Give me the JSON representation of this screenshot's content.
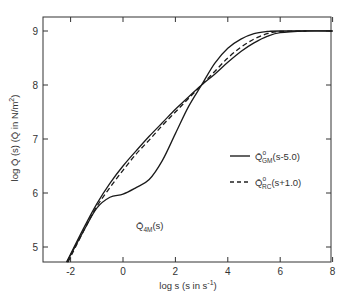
{
  "chart_data": {
    "type": "line",
    "title": "",
    "xlabel": "log s (s in s⁻¹)",
    "ylabel": "log Q̄ (s) (Q̄ in N/m²)",
    "xlim": [
      -2.9,
      8
    ],
    "ylim": [
      4.72,
      9.25
    ],
    "x_ticks": [
      -2,
      0,
      2,
      4,
      6,
      8
    ],
    "y_ticks": [
      5,
      6,
      7,
      8,
      9
    ],
    "grid": false,
    "legend_position": "center-right",
    "series": [
      {
        "name": "Q̄°GM(s-5.0)",
        "style": "solid",
        "x": [
          -2.15,
          -1.5,
          -1,
          -0.5,
          0,
          0.5,
          1,
          1.5,
          2,
          2.5,
          3,
          3.5,
          4,
          4.5,
          5,
          5.5,
          6,
          7,
          8
        ],
        "y": [
          4.72,
          5.35,
          5.8,
          6.18,
          6.5,
          6.78,
          7.05,
          7.3,
          7.55,
          7.78,
          8.0,
          8.2,
          8.42,
          8.62,
          8.78,
          8.9,
          8.97,
          9.0,
          9.0
        ]
      },
      {
        "name": "Q̄°RC(s+1.0)",
        "style": "dashed",
        "x": [
          -2.1,
          -1.5,
          -1,
          -0.5,
          0,
          0.5,
          1,
          1.5,
          2,
          2.5,
          3,
          3.5,
          4,
          4.5,
          5,
          5.5,
          6,
          7
        ],
        "y": [
          4.72,
          5.3,
          5.75,
          6.1,
          6.42,
          6.72,
          6.98,
          7.25,
          7.5,
          7.75,
          8.0,
          8.25,
          8.5,
          8.7,
          8.85,
          8.95,
          8.99,
          9.0
        ]
      },
      {
        "name": "Q̄ 4M(s)",
        "style": "solid",
        "x": [
          -2.15,
          -1.5,
          -1,
          -0.5,
          0,
          0.5,
          1,
          1.5,
          2,
          2.5,
          3,
          3.5,
          4,
          4.5,
          5,
          5.5,
          6,
          8
        ],
        "y": [
          4.72,
          5.3,
          5.72,
          5.92,
          5.98,
          6.1,
          6.25,
          6.6,
          7.1,
          7.6,
          8.0,
          8.4,
          8.68,
          8.85,
          8.95,
          8.99,
          9.0,
          9.0
        ]
      }
    ],
    "annotations": [
      {
        "text": "Q̄",
        "sub": "4M",
        "suffix": "(s)",
        "x": 0.7,
        "y": 5.72
      }
    ]
  },
  "labels": {
    "xlabel_main": "log s (s in s",
    "xlabel_sup": "-1",
    "xlabel_end": ")",
    "ylabel_main": "log Q̄ (s) (Q̄ in N/m",
    "ylabel_sup": "2",
    "ylabel_end": ")",
    "legend": [
      {
        "q": "Q̄",
        "sup": "o",
        "sub": "GM",
        "arg": "(s-5.0)"
      },
      {
        "q": "Q̄",
        "sup": "o",
        "sub": "RC",
        "arg": "(s+1.0)"
      }
    ],
    "annot_q": "Q̄",
    "annot_sub": "4M",
    "annot_arg": "(s)"
  },
  "tick_labels": {
    "x": [
      "-2",
      "0",
      "2",
      "4",
      "6",
      "8"
    ],
    "y": [
      "5",
      "6",
      "7",
      "8",
      "9"
    ]
  }
}
